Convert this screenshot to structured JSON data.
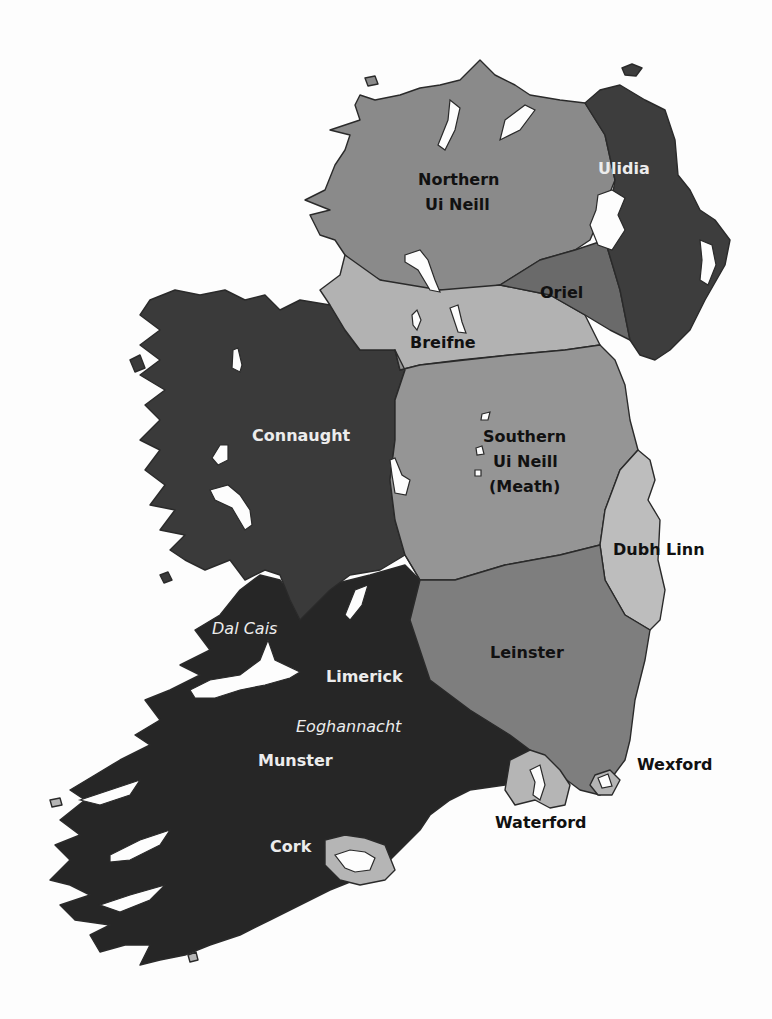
{
  "map": {
    "title": "Kingdoms of early medieval Ireland",
    "colors": {
      "background": "#fdfdfd",
      "northern_ui_neill": "#8a8a8a",
      "ulidia": "#3d3d3d",
      "oriel": "#6a6a6a",
      "breifne": "#b2b2b2",
      "connaught": "#3a3a3a",
      "southern_ui_neill": "#959595",
      "dubh_linn": "#bdbdbd",
      "leinster": "#7e7e7e",
      "munster": "#262626",
      "viking_towns": "#b5b5b5",
      "water": "#fdfdfd"
    },
    "labels": {
      "northern_ui_neill_1": "Northern",
      "northern_ui_neill_2": "Ui Neill",
      "ulidia": "Ulidia",
      "oriel": "Oriel",
      "breifne": "Breifne",
      "connaught": "Connaught",
      "southern_ui_neill_1": "Southern",
      "southern_ui_neill_2": "Ui Neill",
      "southern_ui_neill_3": "(Meath)",
      "dubh_linn": "Dubh Linn",
      "leinster": "Leinster",
      "dal_cais": "Dal Cais",
      "limerick": "Limerick",
      "eoghannacht": "Eoghannacht",
      "munster": "Munster",
      "cork": "Cork",
      "waterford": "Waterford",
      "wexford": "Wexford"
    }
  }
}
